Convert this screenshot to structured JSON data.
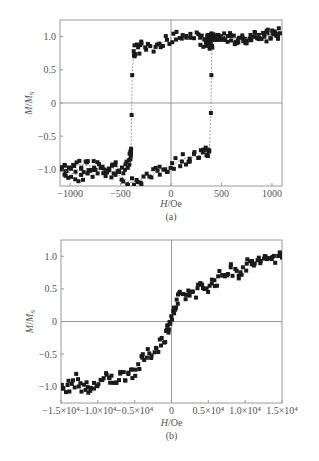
{
  "chart_data": [
    {
      "id": "a",
      "type": "scatter",
      "title": "",
      "caption": "(a)",
      "xlabel": "H/Oe",
      "ylabel": "M/MS",
      "xlim": [
        -1100,
        1100
      ],
      "ylim": [
        -1.25,
        1.25
      ],
      "xticks": [
        -1000,
        -500,
        0,
        500,
        1000
      ],
      "xtick_labels": [
        "−1000",
        "−500",
        "0",
        "500",
        "1000"
      ],
      "yticks": [
        1.0,
        0.5,
        0,
        -0.5,
        -1.0
      ],
      "ytick_labels": [
        "1.0",
        "0.5",
        "0",
        "−0.5",
        "−1.0"
      ],
      "grid": false,
      "zero_lines": true,
      "description": "Square hysteresis loop with coercive field ≈ ±400 Oe; saturation at ±1 with scatter ≈ ±0.1",
      "series": [
        {
          "name": "descending branch (upper)",
          "x": [
            1080,
            1000,
            900,
            800,
            700,
            600,
            500,
            420,
            400,
            390,
            385,
            380,
            370,
            350,
            300,
            200,
            100,
            0,
            -100,
            -200,
            -300,
            -350,
            -370,
            -385,
            -390,
            -395,
            -400,
            -420,
            -500,
            -600,
            -700,
            -800,
            -900,
            -1000,
            -1080
          ],
          "y": [
            1.05,
            1.02,
            1.0,
            0.98,
            0.95,
            0.97,
            1.0,
            1.0,
            0.98,
            0.95,
            0.9,
            0.92,
            0.95,
            0.9,
            0.95,
            1.0,
            1.0,
            0.97,
            0.9,
            0.85,
            0.85,
            0.8,
            0.78,
            0.42,
            -0.18,
            -0.72,
            -0.8,
            -0.9,
            -0.95,
            -1.0,
            -1.0,
            -0.95,
            -0.92,
            -0.95,
            -1.0
          ]
        },
        {
          "name": "ascending branch (lower)",
          "x": [
            -1080,
            -1000,
            -900,
            -800,
            -700,
            -600,
            -500,
            -400,
            -300,
            -200,
            -100,
            0,
            100,
            200,
            300,
            350,
            380,
            395,
            400,
            405,
            420,
            500,
            600,
            700,
            800,
            900,
            1000,
            1080
          ],
          "y": [
            -1.0,
            -1.05,
            -1.1,
            -1.05,
            -1.0,
            -1.05,
            -1.1,
            -1.2,
            -1.15,
            -1.1,
            -1.0,
            -0.95,
            -0.85,
            -0.82,
            -0.78,
            -0.75,
            -0.72,
            -0.15,
            0.42,
            0.9,
            0.95,
            1.0,
            1.0,
            0.95,
            1.0,
            1.02,
            1.05,
            1.05
          ]
        }
      ],
      "coercive_field_Oe": 400
    },
    {
      "id": "b",
      "type": "scatter",
      "title": "",
      "caption": "(b)",
      "xlabel": "H/Oe",
      "ylabel": "M/MS",
      "xlim": [
        -15000,
        15000
      ],
      "ylim": [
        -1.25,
        1.25
      ],
      "xticks": [
        -15000,
        -10000,
        -5000,
        0,
        5000,
        10000,
        15000
      ],
      "xtick_labels": [
        "−1.5×10⁴",
        "−1.0×10⁴",
        "−0.5×10⁴",
        "0",
        "0.5×10⁴",
        "1.0×10⁴",
        "1.5×10⁴"
      ],
      "yticks": [
        1.0,
        0.5,
        0,
        -0.5,
        -1.0
      ],
      "ytick_labels": [
        "1.0",
        "0.5",
        "0",
        "−0.5",
        "−1.0"
      ],
      "grid": false,
      "zero_lines": true,
      "description": "S-shaped magnetization curve, no visible hysteresis, saturating near ±1 at ±1.5×10⁴ Oe",
      "series": [
        {
          "name": "M/MS",
          "x": [
            -15000,
            -14000,
            -13000,
            -12000,
            -11000,
            -10000,
            -9000,
            -8000,
            -7000,
            -6000,
            -5000,
            -4000,
            -3000,
            -2000,
            -1000,
            -500,
            0,
            500,
            1000,
            2000,
            3000,
            4000,
            5000,
            6000,
            7000,
            8000,
            9000,
            10000,
            11000,
            12000,
            13000,
            14000,
            15000
          ],
          "y": [
            -1.05,
            -1.0,
            -0.9,
            -1.0,
            -1.05,
            -0.95,
            -0.88,
            -0.9,
            -0.85,
            -0.8,
            -0.75,
            -0.6,
            -0.5,
            -0.4,
            -0.25,
            -0.1,
            0.05,
            0.2,
            0.35,
            0.42,
            0.45,
            0.52,
            0.55,
            0.62,
            0.72,
            0.8,
            0.75,
            0.85,
            0.9,
            0.92,
            0.95,
            1.0,
            0.98
          ]
        }
      ]
    }
  ]
}
